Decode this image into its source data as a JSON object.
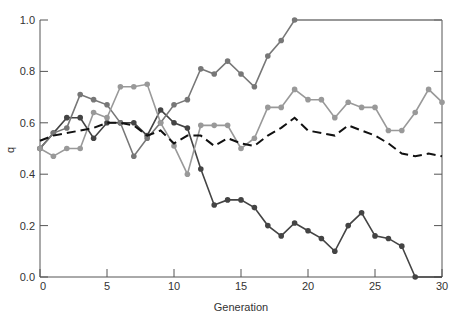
{
  "chart_data": {
    "type": "line",
    "title": "",
    "xlabel": "Generation",
    "ylabel": "q",
    "xlim": [
      0,
      30
    ],
    "ylim": [
      0.0,
      1.0
    ],
    "x_ticks": [
      0,
      5,
      10,
      15,
      20,
      25,
      30
    ],
    "y_ticks": [
      "0.0",
      "0.2",
      "0.4",
      "0.6",
      "0.8",
      "1.0"
    ],
    "grid": false,
    "legend": null,
    "x": [
      0,
      1,
      2,
      3,
      4,
      5,
      6,
      7,
      8,
      9,
      10,
      11,
      12,
      13,
      14,
      15,
      16,
      17,
      18,
      19,
      20,
      21,
      22,
      23,
      24,
      25,
      26,
      27,
      28,
      29,
      30
    ],
    "series": [
      {
        "name": "population-1-lost",
        "style": "solid-markers",
        "color": "#444444",
        "values": [
          0.5,
          0.56,
          0.62,
          0.62,
          0.54,
          0.6,
          0.6,
          0.6,
          0.55,
          0.65,
          0.6,
          0.58,
          0.42,
          0.28,
          0.3,
          0.3,
          0.27,
          0.2,
          0.16,
          0.21,
          0.18,
          0.15,
          0.1,
          0.2,
          0.25,
          0.16,
          0.15,
          0.12,
          0.0,
          0.0,
          0.0
        ]
      },
      {
        "name": "population-2-fixed",
        "style": "solid-markers",
        "color": "#777777",
        "values": [
          0.5,
          0.56,
          0.58,
          0.71,
          0.69,
          0.67,
          0.6,
          0.47,
          0.54,
          0.6,
          0.67,
          0.69,
          0.81,
          0.79,
          0.84,
          0.79,
          0.74,
          0.86,
          0.92,
          1.0,
          1.0,
          1.0,
          1.0,
          1.0,
          1.0,
          1.0,
          1.0,
          1.0,
          1.0,
          1.0,
          1.0
        ]
      },
      {
        "name": "population-3",
        "style": "solid-markers",
        "color": "#999999",
        "values": [
          0.5,
          0.47,
          0.5,
          0.5,
          0.64,
          0.62,
          0.74,
          0.74,
          0.75,
          0.6,
          0.51,
          0.4,
          0.59,
          0.59,
          0.59,
          0.5,
          0.54,
          0.66,
          0.66,
          0.73,
          0.69,
          0.69,
          0.62,
          0.68,
          0.66,
          0.66,
          0.57,
          0.57,
          0.64,
          0.73,
          0.68
        ]
      },
      {
        "name": "mean",
        "style": "dashed",
        "color": "#111111",
        "values": [
          0.53,
          0.55,
          0.56,
          0.57,
          0.58,
          0.6,
          0.6,
          0.59,
          0.55,
          0.57,
          0.52,
          0.55,
          0.55,
          0.51,
          0.54,
          0.52,
          0.51,
          0.55,
          0.58,
          0.62,
          0.57,
          0.56,
          0.55,
          0.59,
          0.57,
          0.55,
          0.52,
          0.48,
          0.47,
          0.48,
          0.47
        ]
      }
    ]
  }
}
